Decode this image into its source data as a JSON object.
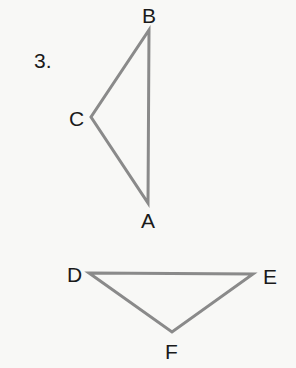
{
  "problem_number": "3.",
  "triangles": [
    {
      "name": "ABC",
      "vertices": {
        "A": {
          "label": "A",
          "x": 148,
          "y": 203
        },
        "B": {
          "label": "B",
          "x": 149,
          "y": 30
        },
        "C": {
          "label": "C",
          "x": 91,
          "y": 117
        }
      }
    },
    {
      "name": "DEF",
      "vertices": {
        "D": {
          "label": "D",
          "x": 89,
          "y": 273
        },
        "E": {
          "label": "E",
          "x": 253,
          "y": 274
        },
        "F": {
          "label": "F",
          "x": 172,
          "y": 332
        }
      }
    }
  ],
  "colors": {
    "stroke": "#8a8a8a",
    "text": "#1a1a1a",
    "background": "#f8f8f6"
  }
}
